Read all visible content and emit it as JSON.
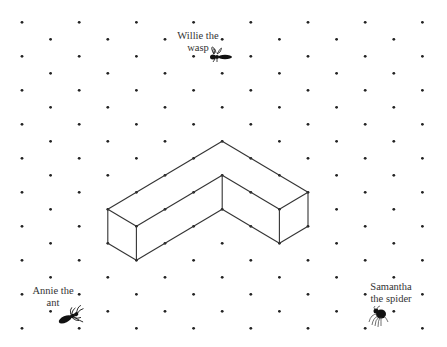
{
  "diagram": {
    "type": "isometric-dot-grid",
    "grid": {
      "columns": 15,
      "rows": 19,
      "dot_color": "#222222"
    },
    "shape": {
      "name": "L-shaped prism",
      "line_color": "#333333",
      "vertices": {
        "apex_top": [
          7,
          7
        ],
        "left_back_top": [
          3,
          11
        ],
        "left_front_top": [
          4,
          12
        ],
        "left_front_bottom": [
          4,
          14
        ],
        "left_back_bottom": [
          3,
          13
        ],
        "inner_top": [
          7,
          9
        ],
        "inner_bottom": [
          7,
          11
        ],
        "right_front_top": [
          9,
          11
        ],
        "right_front_bottom": [
          9,
          13
        ],
        "right_back_top": [
          10,
          10
        ],
        "right_back_bottom": [
          10,
          12
        ]
      },
      "edges": [
        [
          "apex_top",
          "left_back_top"
        ],
        [
          "apex_top",
          "right_back_top"
        ],
        [
          "left_back_top",
          "left_front_top"
        ],
        [
          "left_back_top",
          "left_back_bottom"
        ],
        [
          "left_back_bottom",
          "left_front_bottom"
        ],
        [
          "left_front_top",
          "left_front_bottom"
        ],
        [
          "left_front_top",
          "inner_top"
        ],
        [
          "left_front_bottom",
          "inner_bottom"
        ],
        [
          "inner_top",
          "inner_bottom"
        ],
        [
          "inner_top",
          "right_front_top"
        ],
        [
          "inner_bottom",
          "right_front_bottom"
        ],
        [
          "right_front_top",
          "right_front_bottom"
        ],
        [
          "right_front_top",
          "right_back_top"
        ],
        [
          "right_back_top",
          "right_back_bottom"
        ],
        [
          "right_front_bottom",
          "right_back_bottom"
        ]
      ]
    },
    "creatures": [
      {
        "id": "willie",
        "name": "Willie the wasp",
        "lines": [
          "Willie the",
          "wasp"
        ],
        "icon": "wasp-icon"
      },
      {
        "id": "annie",
        "name": "Annie the ant",
        "lines": [
          "Annie the",
          "ant"
        ],
        "icon": "ant-icon"
      },
      {
        "id": "samantha",
        "name": "Samantha the spider",
        "lines": [
          "Samantha",
          "the spider"
        ],
        "icon": "spider-icon"
      }
    ]
  }
}
